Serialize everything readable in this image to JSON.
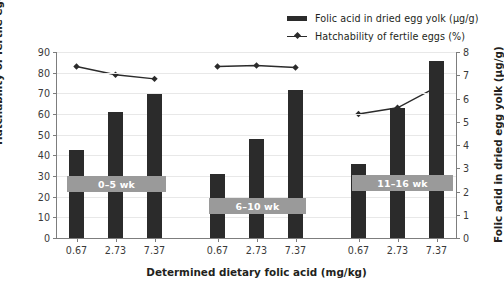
{
  "chart_data": {
    "type": "bar",
    "title": "",
    "xlabel": "Determined dietary folic acid (mg/kg)",
    "ylabel": "Hatchability of fertile eggs (%)",
    "y2label": "Folic acid in dried egg yolk (µg/g)",
    "ylim": [
      0,
      90
    ],
    "y2lim": [
      0,
      8
    ],
    "yticks": [
      "0",
      "10",
      "20",
      "30",
      "40",
      "50",
      "60",
      "70",
      "80",
      "90"
    ],
    "y2ticks": [
      "0",
      "1",
      "2",
      "3",
      "4",
      "5",
      "6",
      "7",
      "8"
    ],
    "grid": true,
    "legend_position": "top-right",
    "categories": [
      "0.67",
      "2.73",
      "7.37",
      "0.67",
      "2.73",
      "7.37",
      "0.67",
      "2.73",
      "7.37"
    ],
    "groups": [
      {
        "label": "0–5 wk",
        "categories": [
          "0.67",
          "2.73",
          "7.37"
        ]
      },
      {
        "label": "6–10 wk",
        "categories": [
          "0.67",
          "2.73",
          "7.37"
        ]
      },
      {
        "label": "11–16 wk",
        "categories": [
          "0.67",
          "2.73",
          "7.37"
        ]
      }
    ],
    "series": [
      {
        "name": "Folic acid in dried egg yolk (µg/g)",
        "axis": "right",
        "type": "bar",
        "color": "#2b2b2b",
        "values": [
          3.8,
          5.4,
          6.2,
          2.75,
          4.25,
          6.35,
          3.2,
          5.6,
          7.6
        ]
      },
      {
        "name": "Hatchability of fertile eggs (%)",
        "axis": "left",
        "type": "line",
        "color": "#2b2b2b",
        "marker": "diamond",
        "values": [
          83.0,
          79.0,
          77.0,
          83.0,
          83.5,
          82.5,
          60.0,
          63.0,
          73.0
        ]
      }
    ]
  },
  "legend": {
    "items": [
      {
        "label": "Folic acid in dried egg yolk (µg/g)",
        "marker": "bar"
      },
      {
        "label": "Hatchability of fertile eggs (%)",
        "marker": "line-diamond"
      }
    ]
  },
  "colors": {
    "bar": "#2b2b2b",
    "line": "#2b2b2b",
    "band": "#9a9a9a",
    "band_text": "#ffffff",
    "grid": "#e8e8e8",
    "axis": "#7d7d7d",
    "text": "#231f20"
  }
}
